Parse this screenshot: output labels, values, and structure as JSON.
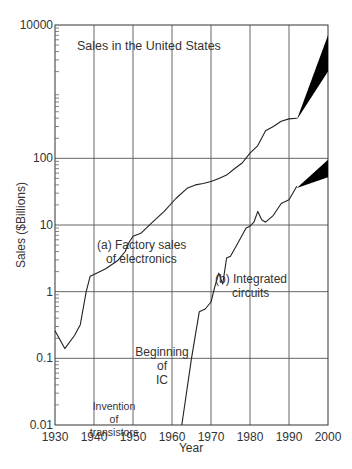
{
  "chart_data": {
    "type": "line",
    "title": "Sales in the United States",
    "xlabel": "Year",
    "ylabel": "Sales ($Billions)",
    "yscale": "log",
    "xlim": [
      1930,
      2000
    ],
    "ylim": [
      0.01,
      10000
    ],
    "x_ticks": [
      "1930",
      "1940",
      "1950",
      "1960",
      "1970",
      "1980",
      "1990",
      "2000"
    ],
    "y_ticks": [
      "10000",
      "100",
      "10",
      "1",
      "0.1",
      "0.01"
    ],
    "grid": true,
    "series": [
      {
        "name": "(a) Factory sales of electronics",
        "label_line1": "(a) Factory sales",
        "label_line2": "of electronics",
        "points": [
          [
            1930,
            0.26
          ],
          [
            1932.5,
            0.14
          ],
          [
            1935,
            0.22
          ],
          [
            1936.5,
            0.32
          ],
          [
            1938,
            1.0
          ],
          [
            1939,
            1.7
          ],
          [
            1940,
            1.8
          ],
          [
            1943,
            2.2
          ],
          [
            1946,
            2.9
          ],
          [
            1948,
            4.0
          ],
          [
            1949,
            5.5
          ],
          [
            1950,
            6.8
          ],
          [
            1952,
            7.5
          ],
          [
            1955,
            11
          ],
          [
            1958,
            16
          ],
          [
            1961,
            25
          ],
          [
            1964,
            36
          ],
          [
            1966,
            40
          ],
          [
            1968,
            42
          ],
          [
            1970,
            45
          ],
          [
            1972,
            50
          ],
          [
            1974,
            56
          ],
          [
            1976,
            70
          ],
          [
            1978,
            85
          ],
          [
            1980,
            120
          ],
          [
            1982,
            155
          ],
          [
            1984,
            260
          ],
          [
            1986,
            300
          ],
          [
            1988,
            360
          ],
          [
            1990,
            390
          ],
          [
            1992,
            400
          ]
        ],
        "projection": {
          "from": [
            1992,
            380
          ],
          "to_high": [
            2000,
            7000
          ],
          "to_low": [
            2000,
            2000
          ]
        }
      },
      {
        "name": "(b) Integrated circuits",
        "label_line1": "(b) Integrated",
        "label_line2": "circuits",
        "points": [
          [
            1962.5,
            0.01
          ],
          [
            1965,
            0.1
          ],
          [
            1967,
            0.5
          ],
          [
            1968.5,
            0.55
          ],
          [
            1970,
            0.7
          ],
          [
            1971,
            1.2
          ],
          [
            1972,
            1.9
          ],
          [
            1973,
            1.3
          ],
          [
            1974,
            3.2
          ],
          [
            1975,
            3.4
          ],
          [
            1977,
            5.5
          ],
          [
            1979,
            9
          ],
          [
            1980,
            9.6
          ],
          [
            1981,
            11
          ],
          [
            1982,
            16
          ],
          [
            1983,
            12
          ],
          [
            1984,
            11
          ],
          [
            1986,
            14
          ],
          [
            1988,
            21
          ],
          [
            1990,
            24
          ],
          [
            1992,
            38
          ]
        ],
        "projection": {
          "from": [
            1992,
            36
          ],
          "to_high": [
            2000,
            95
          ],
          "to_low": [
            2000,
            52
          ]
        }
      }
    ],
    "annotations": [
      {
        "text_lines": [
          "Invention",
          "of",
          "transistors"
        ],
        "x": 1947
      },
      {
        "text_lines": [
          "Beginning",
          "of",
          "IC"
        ],
        "x": 1958
      }
    ]
  },
  "caption_partial": "(clipped caption line at bottom)"
}
